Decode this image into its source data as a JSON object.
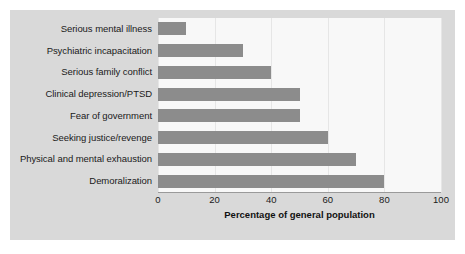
{
  "chart_data": {
    "type": "bar",
    "orientation": "horizontal",
    "title": "",
    "xlabel": "Percentage of general population",
    "ylabel": "",
    "xlim": [
      0,
      100
    ],
    "xticks": [
      0,
      20,
      40,
      60,
      80,
      100
    ],
    "grid": true,
    "legend": false,
    "categories": [
      "Serious mental illness",
      "Psychiatric incapacitation",
      "Serious family conflict",
      "Clinical depression/PTSD",
      "Fear of government",
      "Seeking justice/revenge",
      "Physical and mental exhaustion",
      "Demoralization"
    ],
    "values": [
      10,
      30,
      40,
      50,
      50,
      60,
      70,
      80
    ],
    "bar_color": "#8c8c8c",
    "plot_background": "#f8f8f8",
    "panel_background": "#d9d9d9"
  }
}
